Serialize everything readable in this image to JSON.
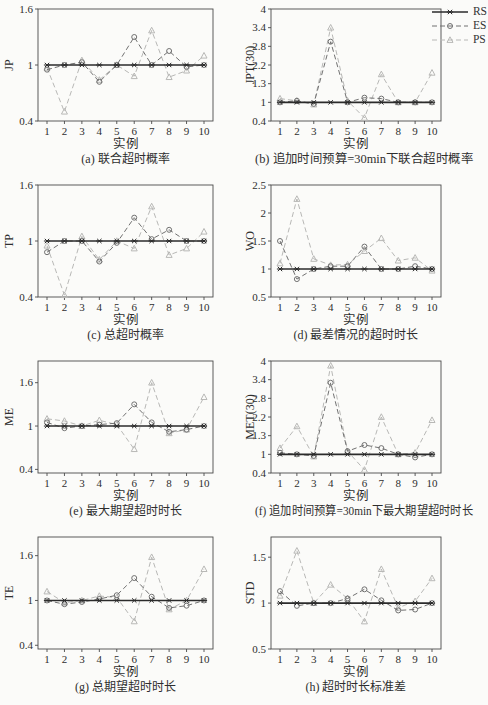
{
  "page": {
    "background": "#fbfbf9"
  },
  "legend": {
    "position": "top-right",
    "items": [
      {
        "label": "RS",
        "marker": "asterisk",
        "line": "solid",
        "color": "#2b2b2b"
      },
      {
        "label": "ES",
        "marker": "circle",
        "line": "dashed",
        "color": "#717171"
      },
      {
        "label": "PS",
        "marker": "triangle",
        "line": "dashed",
        "color": "#b8b8b6"
      }
    ]
  },
  "chart_data": [
    {
      "id": "a",
      "type": "line",
      "caption": "(a) 联合超时概率",
      "ylabel": "JP",
      "xlabel": "实例",
      "x": [
        1,
        2,
        3,
        4,
        5,
        6,
        7,
        8,
        9,
        10
      ],
      "ylim": [
        0.4,
        1.6
      ],
      "grid": false,
      "yticks": [
        {
          "pos": 0.4,
          "label": "0.4"
        },
        {
          "pos": 1,
          "label": "1"
        },
        {
          "pos": 1.6,
          "label": "1.6"
        }
      ],
      "series": [
        {
          "name": "RS",
          "values": [
            1,
            1,
            1,
            1,
            1,
            1,
            1,
            1,
            1,
            1
          ]
        },
        {
          "name": "ES",
          "values": [
            0.95,
            1.0,
            1.03,
            0.82,
            1.0,
            1.3,
            1.0,
            1.15,
            0.98,
            1.0
          ]
        },
        {
          "name": "PS",
          "values": [
            0.97,
            0.5,
            1.05,
            0.84,
            1.0,
            0.88,
            1.37,
            0.87,
            0.94,
            1.1
          ]
        }
      ]
    },
    {
      "id": "b",
      "type": "line",
      "caption": "(b) 追加时间预算=30min下联合超时概率",
      "ylabel": "JPT(30)",
      "xlabel": "实例",
      "x": [
        1,
        2,
        3,
        4,
        5,
        6,
        7,
        8,
        9,
        10
      ],
      "ylim": [
        0.4,
        4.0
      ],
      "grid": false,
      "yticks": [
        {
          "pos": 0.4,
          "label": "0.4"
        },
        {
          "pos": 1,
          "label": "1"
        },
        {
          "pos": 1.6,
          "label": "1.3"
        },
        {
          "pos": 2.2,
          "label": "2.2"
        },
        {
          "pos": 2.8,
          "label": "2.8"
        },
        {
          "pos": 3.4,
          "label": "3.4"
        },
        {
          "pos": 4,
          "label": "4"
        }
      ],
      "series": [
        {
          "name": "RS",
          "values": [
            1,
            1,
            1,
            1,
            1,
            1,
            1,
            1,
            1,
            1
          ]
        },
        {
          "name": "ES",
          "values": [
            1.0,
            1.05,
            0.95,
            2.95,
            1.0,
            1.15,
            1.12,
            1.0,
            1.0,
            1.0
          ]
        },
        {
          "name": "PS",
          "values": [
            1.12,
            1.05,
            0.93,
            3.4,
            1.05,
            0.5,
            1.9,
            1.0,
            1.0,
            1.95
          ]
        }
      ]
    },
    {
      "id": "c",
      "type": "line",
      "caption": "(c) 总超时概率",
      "ylabel": "TP",
      "xlabel": "实例",
      "x": [
        1,
        2,
        3,
        4,
        5,
        6,
        7,
        8,
        9,
        10
      ],
      "ylim": [
        0.4,
        1.6
      ],
      "grid": false,
      "yticks": [
        {
          "pos": 0.4,
          "label": "0.4"
        },
        {
          "pos": 1,
          "label": "1"
        },
        {
          "pos": 1.6,
          "label": "1.6"
        }
      ],
      "series": [
        {
          "name": "RS",
          "values": [
            1,
            1,
            1,
            1,
            1,
            1,
            1,
            1,
            1,
            1
          ]
        },
        {
          "name": "ES",
          "values": [
            0.88,
            1.0,
            1.0,
            0.78,
            0.98,
            1.25,
            1.02,
            1.12,
            1.0,
            1.0
          ]
        },
        {
          "name": "PS",
          "values": [
            0.95,
            0.42,
            1.05,
            0.8,
            1.0,
            0.92,
            1.37,
            0.85,
            0.92,
            1.1
          ]
        }
      ]
    },
    {
      "id": "d",
      "type": "line",
      "caption": "(d) 最差情况的超时时长",
      "ylabel": "WO",
      "xlabel": "实例",
      "x": [
        1,
        2,
        3,
        4,
        5,
        6,
        7,
        8,
        9,
        10
      ],
      "ylim": [
        0.5,
        2.5
      ],
      "grid": false,
      "yticks": [
        {
          "pos": 0.5,
          "label": "0.5"
        },
        {
          "pos": 1,
          "label": "1"
        },
        {
          "pos": 1.5,
          "label": "1.5"
        },
        {
          "pos": 2,
          "label": "2"
        },
        {
          "pos": 2.5,
          "label": "2.5"
        }
      ],
      "series": [
        {
          "name": "RS",
          "values": [
            1,
            1,
            1,
            1,
            1,
            1,
            1,
            1,
            1,
            1
          ]
        },
        {
          "name": "ES",
          "values": [
            1.5,
            0.82,
            1.0,
            1.05,
            1.05,
            1.4,
            1.0,
            1.0,
            1.05,
            1.0
          ]
        },
        {
          "name": "PS",
          "values": [
            1.1,
            2.25,
            1.18,
            1.07,
            1.08,
            1.32,
            1.55,
            1.15,
            1.2,
            0.97
          ]
        }
      ]
    },
    {
      "id": "e",
      "type": "line",
      "caption": "(e) 最大期望超时时长",
      "ylabel": "ME",
      "xlabel": "实例",
      "x": [
        1,
        2,
        3,
        4,
        5,
        6,
        7,
        8,
        9,
        10
      ],
      "ylim": [
        0.35,
        1.9
      ],
      "grid": false,
      "yticks": [
        {
          "pos": 0.4,
          "label": "0.4"
        },
        {
          "pos": 1,
          "label": "1"
        },
        {
          "pos": 1.6,
          "label": "1.6"
        }
      ],
      "series": [
        {
          "name": "RS",
          "values": [
            1,
            1,
            1,
            1,
            1,
            1,
            1,
            1,
            1,
            1
          ]
        },
        {
          "name": "ES",
          "values": [
            1.05,
            0.97,
            1.0,
            1.02,
            1.04,
            1.3,
            1.05,
            0.92,
            0.95,
            1.0
          ]
        },
        {
          "name": "PS",
          "values": [
            1.1,
            1.07,
            1.0,
            1.08,
            1.02,
            0.68,
            1.6,
            0.9,
            0.95,
            1.4
          ]
        }
      ]
    },
    {
      "id": "f",
      "type": "line",
      "caption": "(f) 追加时间预算=30min下最大期望超时时长",
      "ylabel": "MET(30)",
      "xlabel": "实例",
      "x": [
        1,
        2,
        3,
        4,
        5,
        6,
        7,
        8,
        9,
        10
      ],
      "ylim": [
        0.4,
        4.0
      ],
      "grid": false,
      "yticks": [
        {
          "pos": 0.4,
          "label": "0.4"
        },
        {
          "pos": 1,
          "label": "1"
        },
        {
          "pos": 1.6,
          "label": "1.3"
        },
        {
          "pos": 2.2,
          "label": "2.2"
        },
        {
          "pos": 2.8,
          "label": "2.8"
        },
        {
          "pos": 3.4,
          "label": "3.4"
        },
        {
          "pos": 4,
          "label": "4"
        }
      ],
      "series": [
        {
          "name": "RS",
          "values": [
            1,
            1,
            1,
            1,
            1,
            1,
            1,
            1,
            1,
            1
          ]
        },
        {
          "name": "ES",
          "values": [
            1.05,
            1.0,
            0.95,
            3.3,
            1.1,
            1.3,
            1.2,
            1.0,
            0.9,
            1.0
          ]
        },
        {
          "name": "PS",
          "values": [
            1.2,
            1.9,
            0.93,
            3.85,
            1.1,
            0.5,
            2.2,
            1.0,
            1.05,
            2.1
          ]
        }
      ]
    },
    {
      "id": "g",
      "type": "line",
      "caption": "(g) 总期望超时时长",
      "ylabel": "TE",
      "xlabel": "实例",
      "x": [
        1,
        2,
        3,
        4,
        5,
        6,
        7,
        8,
        9,
        10
      ],
      "ylim": [
        0.35,
        1.85
      ],
      "grid": false,
      "yticks": [
        {
          "pos": 0.4,
          "label": "0.4"
        },
        {
          "pos": 1,
          "label": "1"
        },
        {
          "pos": 1.6,
          "label": "1.6"
        }
      ],
      "series": [
        {
          "name": "RS",
          "values": [
            1,
            1,
            1,
            1,
            1,
            1,
            1,
            1,
            1,
            1
          ]
        },
        {
          "name": "ES",
          "values": [
            1.0,
            0.95,
            0.98,
            1.02,
            1.07,
            1.3,
            1.05,
            0.9,
            0.93,
            1.0
          ]
        },
        {
          "name": "PS",
          "values": [
            1.12,
            0.97,
            1.0,
            1.06,
            1.04,
            0.72,
            1.58,
            0.88,
            1.0,
            1.42
          ]
        }
      ]
    },
    {
      "id": "h",
      "type": "line",
      "caption": "(h) 超时时长标准差",
      "ylabel": "STD",
      "xlabel": "实例",
      "x": [
        1,
        2,
        3,
        4,
        5,
        6,
        7,
        8,
        9,
        10
      ],
      "ylim": [
        0.5,
        1.72
      ],
      "grid": false,
      "yticks": [
        {
          "pos": 0.5,
          "label": "0.5"
        },
        {
          "pos": 1,
          "label": "1"
        },
        {
          "pos": 1.5,
          "label": "1.5"
        }
      ],
      "series": [
        {
          "name": "RS",
          "values": [
            1,
            1,
            1,
            1,
            1,
            1,
            1,
            1,
            1,
            1
          ]
        },
        {
          "name": "ES",
          "values": [
            1.13,
            0.97,
            1.0,
            1.0,
            1.05,
            1.15,
            1.03,
            0.92,
            0.93,
            1.0
          ]
        },
        {
          "name": "PS",
          "values": [
            1.08,
            1.57,
            1.0,
            1.2,
            1.05,
            0.8,
            1.37,
            0.95,
            1.02,
            1.27
          ]
        }
      ]
    }
  ]
}
